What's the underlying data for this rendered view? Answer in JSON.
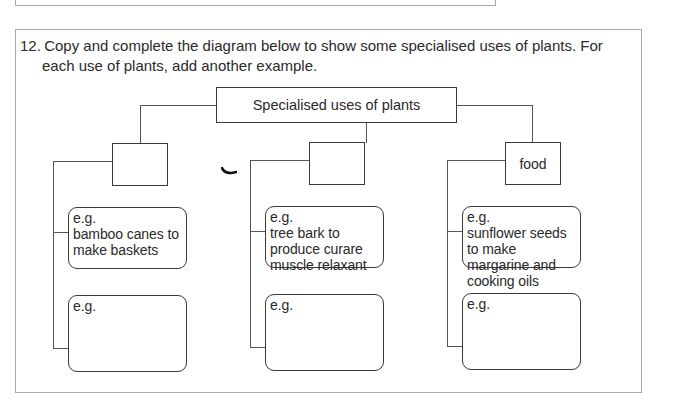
{
  "question": {
    "number": "12.",
    "line1": "Copy and complete the diagram below to show some specialised uses of plants.  For",
    "line2": "each use of plants, add another example."
  },
  "diagram": {
    "root": "Specialised uses of plants",
    "categories": [
      {
        "label": "",
        "examples": [
          {
            "prefix": "e.g.",
            "text": "bamboo canes to make baskets"
          },
          {
            "prefix": "e.g.",
            "text": ""
          }
        ]
      },
      {
        "label": "",
        "examples": [
          {
            "prefix": "e.g.",
            "text": "tree bark to produce curare muscle relaxant"
          },
          {
            "prefix": "e.g.",
            "text": ""
          }
        ]
      },
      {
        "label": "food",
        "examples": [
          {
            "prefix": "e.g.",
            "text": "sunflower seeds to make margarine and cooking oils"
          },
          {
            "prefix": "e.g.",
            "text": ""
          }
        ]
      }
    ]
  },
  "colors": {
    "frame": "#a9a9a9",
    "box_border": "#3a3a3a",
    "connector": "#555555",
    "text": "#2a2a2a"
  }
}
